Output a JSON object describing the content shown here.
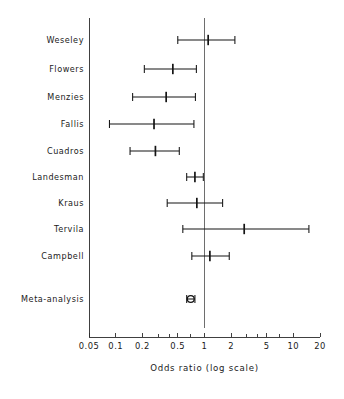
{
  "figure": {
    "axis_title": "Odds ratio (log scale)",
    "scale": "log",
    "reference_value": 1
  },
  "axis": {
    "ticks": [
      {
        "label": "0.05",
        "value": 0.05
      },
      {
        "label": "0.1",
        "value": 0.1
      },
      {
        "label": "0.2",
        "value": 0.2
      },
      {
        "label": "0.5",
        "value": 0.5
      },
      {
        "label": "1",
        "value": 1
      },
      {
        "label": "2",
        "value": 2
      },
      {
        "label": "5",
        "value": 5
      },
      {
        "label": "10",
        "value": 10
      },
      {
        "label": "20",
        "value": 20
      }
    ],
    "minor_ticks": [
      0.3,
      0.4,
      0.7,
      3,
      4,
      7
    ],
    "range": [
      0.05,
      20
    ]
  },
  "rows": [
    {
      "label": "Weseley",
      "estimate": 1.1,
      "ci_low": 0.5,
      "ci_high": 2.2,
      "type": "study"
    },
    {
      "label": "Flowers",
      "estimate": 0.44,
      "ci_low": 0.21,
      "ci_high": 0.81,
      "type": "study"
    },
    {
      "label": "Menzies",
      "estimate": 0.37,
      "ci_low": 0.155,
      "ci_high": 0.79,
      "type": "study"
    },
    {
      "label": "Fallis",
      "estimate": 0.27,
      "ci_low": 0.085,
      "ci_high": 0.76,
      "type": "study"
    },
    {
      "label": "Cuadros",
      "estimate": 0.28,
      "ci_low": 0.145,
      "ci_high": 0.52,
      "type": "study"
    },
    {
      "label": "Landesman",
      "estimate": 0.78,
      "ci_low": 0.63,
      "ci_high": 0.97,
      "type": "study"
    },
    {
      "label": "Kraus",
      "estimate": 0.82,
      "ci_low": 0.38,
      "ci_high": 1.6,
      "type": "study"
    },
    {
      "label": "Tervila",
      "estimate": 2.8,
      "ci_low": 0.57,
      "ci_high": 15.0,
      "type": "study"
    },
    {
      "label": "Campbell",
      "estimate": 1.15,
      "ci_low": 0.72,
      "ci_high": 1.9,
      "type": "study"
    },
    {
      "label": "Meta-analysis",
      "estimate": 0.7,
      "ci_low": 0.63,
      "ci_high": 0.78,
      "type": "summary"
    }
  ],
  "chart_data": {
    "type": "scatter",
    "title": "",
    "subtitle": "",
    "xlabel": "Odds ratio (log scale)",
    "ylabel": "",
    "xscale": "log",
    "xlim": [
      0.05,
      20
    ],
    "grid": false,
    "legend": "none",
    "reference_line_x": 1,
    "xtick_labels": [
      "0.05",
      "0.1",
      "0.2",
      "0.5",
      "1",
      "2",
      "5",
      "10",
      "20"
    ],
    "xtick_values": [
      0.05,
      0.1,
      0.2,
      0.5,
      1,
      2,
      5,
      10,
      20
    ],
    "categories": [
      "Weseley",
      "Flowers",
      "Menzies",
      "Fallis",
      "Cuadros",
      "Landesman",
      "Kraus",
      "Tervila",
      "Campbell",
      "Meta-analysis"
    ],
    "values": [
      1.1,
      0.44,
      0.37,
      0.27,
      0.28,
      0.78,
      0.82,
      2.8,
      1.15,
      0.7
    ],
    "ci_low": [
      0.5,
      0.21,
      0.155,
      0.085,
      0.145,
      0.63,
      0.38,
      0.57,
      0.72,
      0.63
    ],
    "ci_high": [
      2.2,
      0.81,
      0.79,
      0.76,
      0.52,
      0.97,
      1.6,
      15.0,
      1.9,
      0.78
    ],
    "annotations": [
      "Meta-analysis row shown with open summary marker"
    ]
  }
}
